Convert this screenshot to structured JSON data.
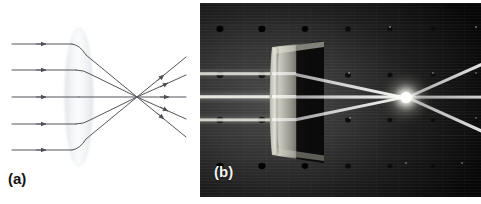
{
  "figure": {
    "panels": [
      {
        "id": "a",
        "label": "(a)",
        "type": "ray-diagram",
        "description": "Schematic ray diagram of a biconvex converging lens bringing five parallel rays to a focus"
      },
      {
        "id": "b",
        "label": "(b)",
        "type": "photograph",
        "description": "Photograph of laser beams converging through a real lens on an optical breadboard"
      }
    ]
  },
  "panel_a": {
    "label": "(a)",
    "lens": {
      "name": "biconvex-lens",
      "center_x": 79,
      "center_y": 97,
      "half_width": 14,
      "half_height": 69,
      "fill": "#eceef0",
      "edge": "#d8dce0"
    },
    "optical_axis": {
      "y": 97,
      "color": "#5a5a60"
    },
    "focal_point": {
      "x": 137,
      "y": 97
    },
    "ray_color": "#55555c",
    "ray_width": 1,
    "incoming_ray_start_x": 12,
    "outgoing_ray_end_x": 184,
    "rays": [
      {
        "name": "ray-1",
        "entry_y": 44,
        "hit_y": 44,
        "arrow_in_x": 46,
        "exit_x": 186,
        "exit_y": 23
      },
      {
        "name": "ray-2",
        "entry_y": 70,
        "hit_y": 70,
        "arrow_in_x": 46,
        "exit_x": 186,
        "exit_y": 60
      },
      {
        "name": "ray-3",
        "entry_y": 97,
        "hit_y": 97,
        "arrow_in_x": 46,
        "exit_x": 186,
        "exit_y": 97
      },
      {
        "name": "ray-4",
        "entry_y": 124,
        "hit_y": 124,
        "arrow_in_x": 46,
        "exit_x": 186,
        "exit_y": 134
      },
      {
        "name": "ray-5",
        "entry_y": 150,
        "hit_y": 150,
        "arrow_in_x": 46,
        "exit_x": 186,
        "exit_y": 171
      }
    ]
  },
  "panel_b": {
    "label": "(b)",
    "background_color": "#0b0b0b",
    "breadboard": {
      "name": "optical-breadboard",
      "hole_color": "#000000",
      "hole_radius": 3.4,
      "columns_x": [
        20,
        62,
        105,
        148,
        190,
        233,
        276
      ],
      "rows_y": [
        26,
        72,
        117,
        163
      ]
    },
    "lens_mount": {
      "name": "lens-in-mount",
      "x": 67,
      "y": 38,
      "width": 58,
      "height": 122
    },
    "beams": {
      "name": "laser-beams",
      "color": "#f6f6f0",
      "entry_ys": [
        72,
        95,
        118
      ],
      "focus_x": 206,
      "focus_y": 95,
      "exit_x": 281,
      "exit_ys": [
        62,
        95,
        128
      ]
    },
    "focal_spot": {
      "name": "focal-spot",
      "x": 206,
      "y": 95,
      "radius": 17
    }
  }
}
